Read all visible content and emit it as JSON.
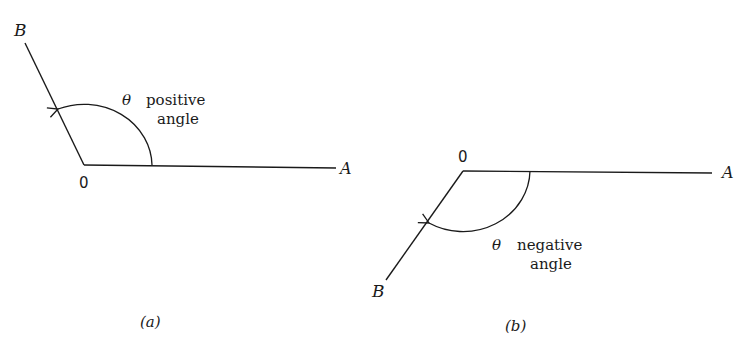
{
  "figures": [
    {
      "id": "a",
      "caption": "(a)",
      "vertex_label": "0",
      "ray_a_label": "A",
      "ray_b_label": "B",
      "angle_symbol": "θ",
      "angle_text_line1": "positive",
      "angle_text_line2": "angle",
      "direction": "counterclockwise"
    },
    {
      "id": "b",
      "caption": "(b)",
      "vertex_label": "0",
      "ray_a_label": "A",
      "ray_b_label": "B",
      "angle_symbol": "θ",
      "angle_text_line1": "negative",
      "angle_text_line2": "angle",
      "direction": "clockwise"
    }
  ],
  "colors": {
    "stroke": "#1a1a1a",
    "background": "#ffffff"
  }
}
